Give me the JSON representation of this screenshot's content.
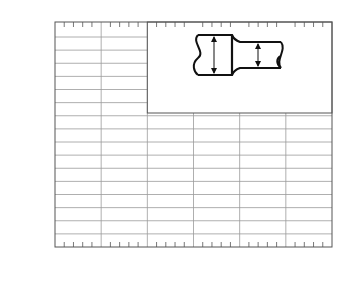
{
  "chart_data": {
    "type": "line",
    "title": "",
    "xlabel": "r/d",
    "ylabel": "K_t",
    "xlim": [
      0,
      0.3
    ],
    "ylim": [
      1.0,
      2.65
    ],
    "grid": true,
    "x_ticks": [
      "0",
      "0.1",
      "0.2",
      "0.3"
    ],
    "y_ticks": [
      "1.0",
      "1.2",
      "1.4",
      "1.6",
      "1.8",
      "2.0",
      "2.2",
      "2.4",
      "2.6"
    ],
    "series": [
      {
        "name": "D/d = 2",
        "label": "D/d = 2",
        "x": [
          0.045,
          0.05,
          0.06,
          0.08,
          0.1,
          0.13,
          0.16,
          0.2,
          0.25,
          0.3
        ],
        "y": [
          2.64,
          2.55,
          2.42,
          2.22,
          2.06,
          1.9,
          1.78,
          1.66,
          1.55,
          1.46
        ]
      },
      {
        "name": "D/d = 1.5",
        "label": "1.5",
        "x": [
          0.04,
          0.05,
          0.06,
          0.08,
          0.1,
          0.13,
          0.16,
          0.2,
          0.25,
          0.3
        ],
        "y": [
          2.53,
          2.38,
          2.26,
          2.09,
          1.97,
          1.82,
          1.7,
          1.59,
          1.5,
          1.42
        ]
      },
      {
        "name": "D/d = 1.2",
        "label": "1.2",
        "x": [
          0.035,
          0.05,
          0.06,
          0.08,
          0.1,
          0.13,
          0.16,
          0.2,
          0.25,
          0.3
        ],
        "y": [
          2.38,
          2.13,
          2.01,
          1.85,
          1.74,
          1.61,
          1.52,
          1.44,
          1.38,
          1.33
        ]
      },
      {
        "name": "D/d = 1.05",
        "label": "1.05",
        "x": [
          0.025,
          0.04,
          0.05,
          0.06,
          0.08,
          0.1,
          0.13,
          0.16,
          0.2,
          0.25,
          0.3
        ],
        "y": [
          2.1,
          1.86,
          1.76,
          1.68,
          1.57,
          1.5,
          1.42,
          1.37,
          1.32,
          1.27,
          1.24
        ]
      },
      {
        "name": "D/d = 1.01",
        "label": "1.01",
        "x": [
          0.02,
          0.03,
          0.05,
          0.07,
          0.1,
          0.13,
          0.16,
          0.2,
          0.25,
          0.3
        ],
        "y": [
          1.56,
          1.47,
          1.34,
          1.25,
          1.19,
          1.16,
          1.15,
          1.15,
          1.15,
          1.16
        ]
      }
    ],
    "annotations": {
      "inset_formula": {
        "lhs": "σ",
        "lhs_sub": "nom",
        "eq1_num": "P",
        "eq1_den": "A",
        "eq2_num": "4P",
        "eq2_den": "πd",
        "eq2_den_sup": "2"
      },
      "diagram_labels": {
        "load_left": "P",
        "load_right": "P",
        "large_dia": "D",
        "small_dia": "d",
        "fillet": "r"
      }
    }
  }
}
